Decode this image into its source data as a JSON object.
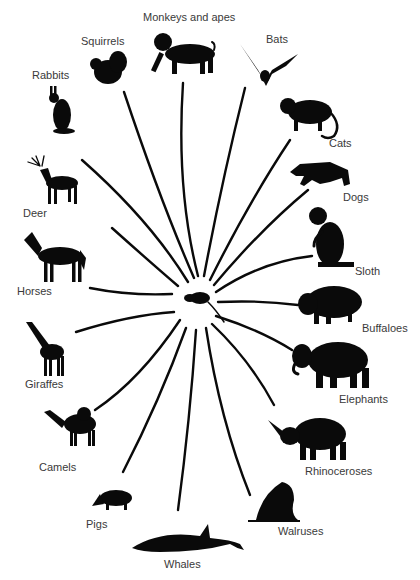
{
  "diagram": {
    "type": "adaptive-radiation",
    "center": {
      "name": "ancestral insectivore",
      "icon": "shrew-icon"
    },
    "groups": [
      {
        "id": "monkeys",
        "label": "Monkeys and apes",
        "icon": "monkey-icon"
      },
      {
        "id": "squirrels",
        "label": "Squirrels",
        "icon": "squirrel-icon"
      },
      {
        "id": "bats",
        "label": "Bats",
        "icon": "bat-icon"
      },
      {
        "id": "rabbits",
        "label": "Rabbits",
        "icon": "rabbit-icon"
      },
      {
        "id": "cats",
        "label": "Cats",
        "icon": "cat-icon"
      },
      {
        "id": "deer",
        "label": "Deer",
        "icon": "deer-icon"
      },
      {
        "id": "dogs",
        "label": "Dogs",
        "icon": "dog-icon"
      },
      {
        "id": "sloth",
        "label": "Sloth",
        "icon": "sloth-icon"
      },
      {
        "id": "horses",
        "label": "Horses",
        "icon": "horse-icon"
      },
      {
        "id": "buffaloes",
        "label": "Buffaloes",
        "icon": "buffalo-icon"
      },
      {
        "id": "giraffes",
        "label": "Giraffes",
        "icon": "giraffe-icon"
      },
      {
        "id": "elephants",
        "label": "Elephants",
        "icon": "elephant-icon"
      },
      {
        "id": "camels",
        "label": "Camels",
        "icon": "camel-icon"
      },
      {
        "id": "rhinoceroses",
        "label": "Rhinoceroses",
        "icon": "rhinoceros-icon"
      },
      {
        "id": "pigs",
        "label": "Pigs",
        "icon": "pig-icon"
      },
      {
        "id": "walruses",
        "label": "Walruses",
        "icon": "walrus-icon"
      },
      {
        "id": "whales",
        "label": "Whales",
        "icon": "whale-icon"
      }
    ],
    "colors": {
      "silhouette": "#0a0a0a",
      "label": "#3a3a3a",
      "background": "#ffffff"
    }
  }
}
